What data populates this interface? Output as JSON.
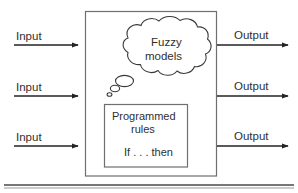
{
  "diagram": {
    "inputs": [
      {
        "label": "Input"
      },
      {
        "label": "Input"
      },
      {
        "label": "Input"
      }
    ],
    "outputs": [
      {
        "label": "Output"
      },
      {
        "label": "Output"
      },
      {
        "label": "Output"
      }
    ],
    "cloud": {
      "line1": "Fuzzy",
      "line2": "models"
    },
    "rules_box": {
      "line1": "Programmed",
      "line2": "rules",
      "line3": "If . . . then"
    },
    "colors": {
      "ink": "#2b2b2b",
      "box_border": "#6f6f6f",
      "cloud_border": "#3a3a3a",
      "arrow": "#232323",
      "rule": "#4a4a4a",
      "background": "#ffffff"
    }
  }
}
